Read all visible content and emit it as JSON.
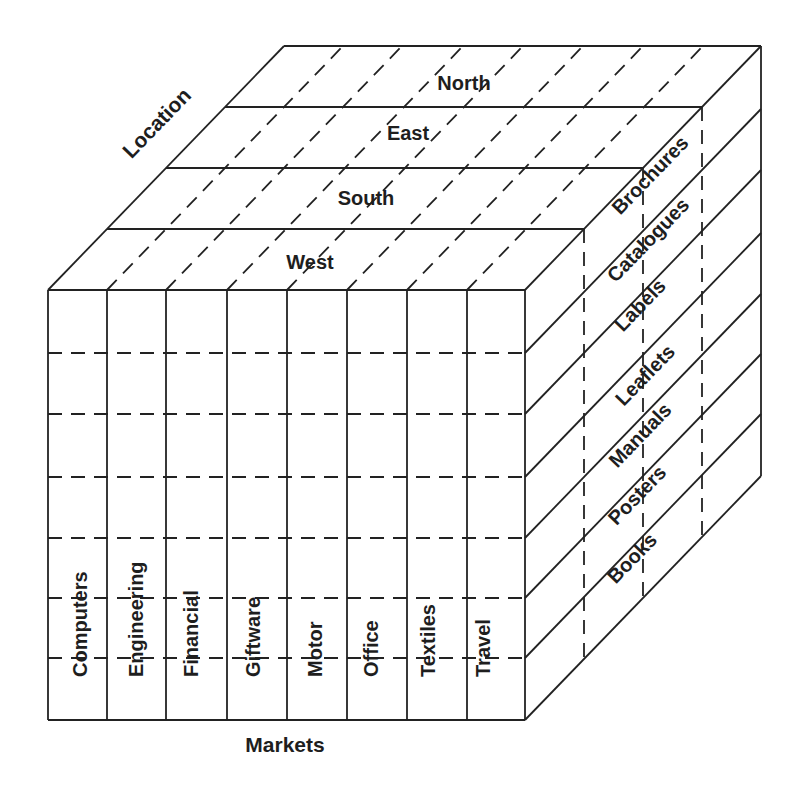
{
  "diagram": {
    "type": "data-cube",
    "axes": {
      "x": {
        "label": "Markets",
        "members": [
          "Computers",
          "Engineering",
          "Financial",
          "Giftware",
          "Motor",
          "Office",
          "Textiles",
          "Travel"
        ]
      },
      "y": {
        "label": "Products",
        "members": [
          "Brochures",
          "Catalogues",
          "Labels",
          "Leaflets",
          "Manuals",
          "Posters",
          "Books"
        ]
      },
      "z": {
        "label": "Location",
        "members": [
          "West",
          "South",
          "East",
          "North"
        ]
      }
    },
    "labels": {
      "location": "Location",
      "markets": "Markets"
    },
    "colors": {
      "line": "#222222",
      "text": "#1e1e1e",
      "background": "#ffffff"
    }
  },
  "geometry": {
    "front": {
      "left": 48,
      "right": 525,
      "top": 290,
      "bottom": 720
    },
    "depth_step": {
      "dx": 59,
      "dy": -61
    },
    "column_x": [
      48,
      107,
      166,
      227,
      287,
      347,
      407,
      467,
      525
    ],
    "row_y": [
      290,
      353,
      414,
      477,
      538,
      598,
      658,
      720
    ],
    "market_label_x": [
      80,
      136,
      191,
      253,
      315,
      371,
      428,
      483
    ],
    "market_label_baseline_y": 677,
    "location_label_pos": [
      [
        310,
        262
      ],
      [
        366,
        198
      ],
      [
        408,
        133
      ],
      [
        464,
        83
      ]
    ],
    "product_label_pos": [
      [
        650,
        175
      ],
      [
        648,
        240
      ],
      [
        640,
        305
      ],
      [
        645,
        375
      ],
      [
        640,
        435
      ],
      [
        637,
        495
      ],
      [
        632,
        558
      ]
    ]
  }
}
